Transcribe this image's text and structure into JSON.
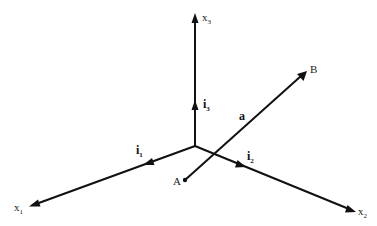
{
  "diagram": {
    "type": "3d-coordinate-system",
    "colors": {
      "background": "#ffffff",
      "stroke": "#111111",
      "text": "#222222"
    },
    "origin": {
      "x": 195,
      "y": 146
    },
    "axes": [
      {
        "id": "x1",
        "label": "x",
        "subscript": "1",
        "tip": {
          "x": 30,
          "y": 206
        },
        "label_pos": {
          "x": 14,
          "y": 211
        }
      },
      {
        "id": "x2",
        "label": "x",
        "subscript": "2",
        "tip": {
          "x": 355,
          "y": 211
        },
        "label_pos": {
          "x": 358,
          "y": 215
        }
      },
      {
        "id": "x3",
        "label": "x",
        "subscript": "3",
        "tip": {
          "x": 195,
          "y": 14
        },
        "label_pos": {
          "x": 202,
          "y": 21
        }
      }
    ],
    "unit_vectors": [
      {
        "id": "i1",
        "label": "i",
        "subscript": "1",
        "arrow_at": {
          "x": 148,
          "y": 163
        },
        "label_pos": {
          "x": 136,
          "y": 154
        }
      },
      {
        "id": "i2",
        "label": "i",
        "subscript": "2",
        "arrow_at": {
          "x": 242,
          "y": 162
        },
        "label_pos": {
          "x": 247,
          "y": 160
        }
      },
      {
        "id": "i3",
        "label": "i",
        "subscript": "3",
        "arrow_at": {
          "x": 195,
          "y": 105
        },
        "label_pos": {
          "x": 203,
          "y": 108
        }
      }
    ],
    "vector": {
      "id": "a",
      "label": "a",
      "label_pos": {
        "x": 239,
        "y": 120
      },
      "start": {
        "label": "A",
        "x": 185,
        "y": 180,
        "label_pos": {
          "x": 173,
          "y": 185
        }
      },
      "end": {
        "label": "B",
        "x": 306,
        "y": 72,
        "label_pos": {
          "x": 310,
          "y": 73
        }
      }
    }
  }
}
